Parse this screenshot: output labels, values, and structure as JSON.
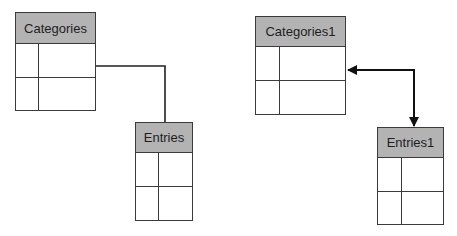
{
  "diagram": {
    "tables": [
      {
        "id": "categories",
        "title": "Categories",
        "rows": 2,
        "columns": 2
      },
      {
        "id": "entries",
        "title": "Entries",
        "rows": 2,
        "columns": 2
      },
      {
        "id": "categories1",
        "title": "Categories1",
        "rows": 2,
        "columns": 2
      },
      {
        "id": "entries1",
        "title": "Entries1",
        "rows": 2,
        "columns": 2
      }
    ],
    "connections": [
      {
        "from": "Categories",
        "to": "Entries",
        "style": "plain-line",
        "arrows": "none"
      },
      {
        "from": "Categories1",
        "to": "Entries1",
        "style": "arrow",
        "arrows": "both"
      }
    ],
    "colors": {
      "header_fill": "#b3b3b3",
      "border": "#3a3a3a",
      "background": "#ffffff"
    }
  }
}
